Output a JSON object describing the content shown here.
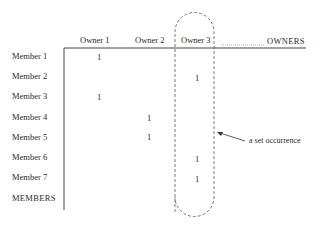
{
  "diagram": {
    "axis_labels": {
      "owners": "OWNERS",
      "members": "MEMBERS"
    },
    "columns": [
      {
        "label": "Owner 1"
      },
      {
        "label": "Owner 2"
      },
      {
        "label": "Owner 3"
      }
    ],
    "rows": [
      {
        "label": "Member 1",
        "owner": 1
      },
      {
        "label": "Member 2",
        "owner": 3
      },
      {
        "label": "Member 3",
        "owner": 1
      },
      {
        "label": "Member 4",
        "owner": 2
      },
      {
        "label": "Member 5",
        "owner": 2
      },
      {
        "label": "Member 6",
        "owner": 3
      },
      {
        "label": "Member 7",
        "owner": 3
      }
    ],
    "mark": "1",
    "annotation": {
      "label": "a set occurrence",
      "highlighted_column": "Owner 3"
    }
  }
}
